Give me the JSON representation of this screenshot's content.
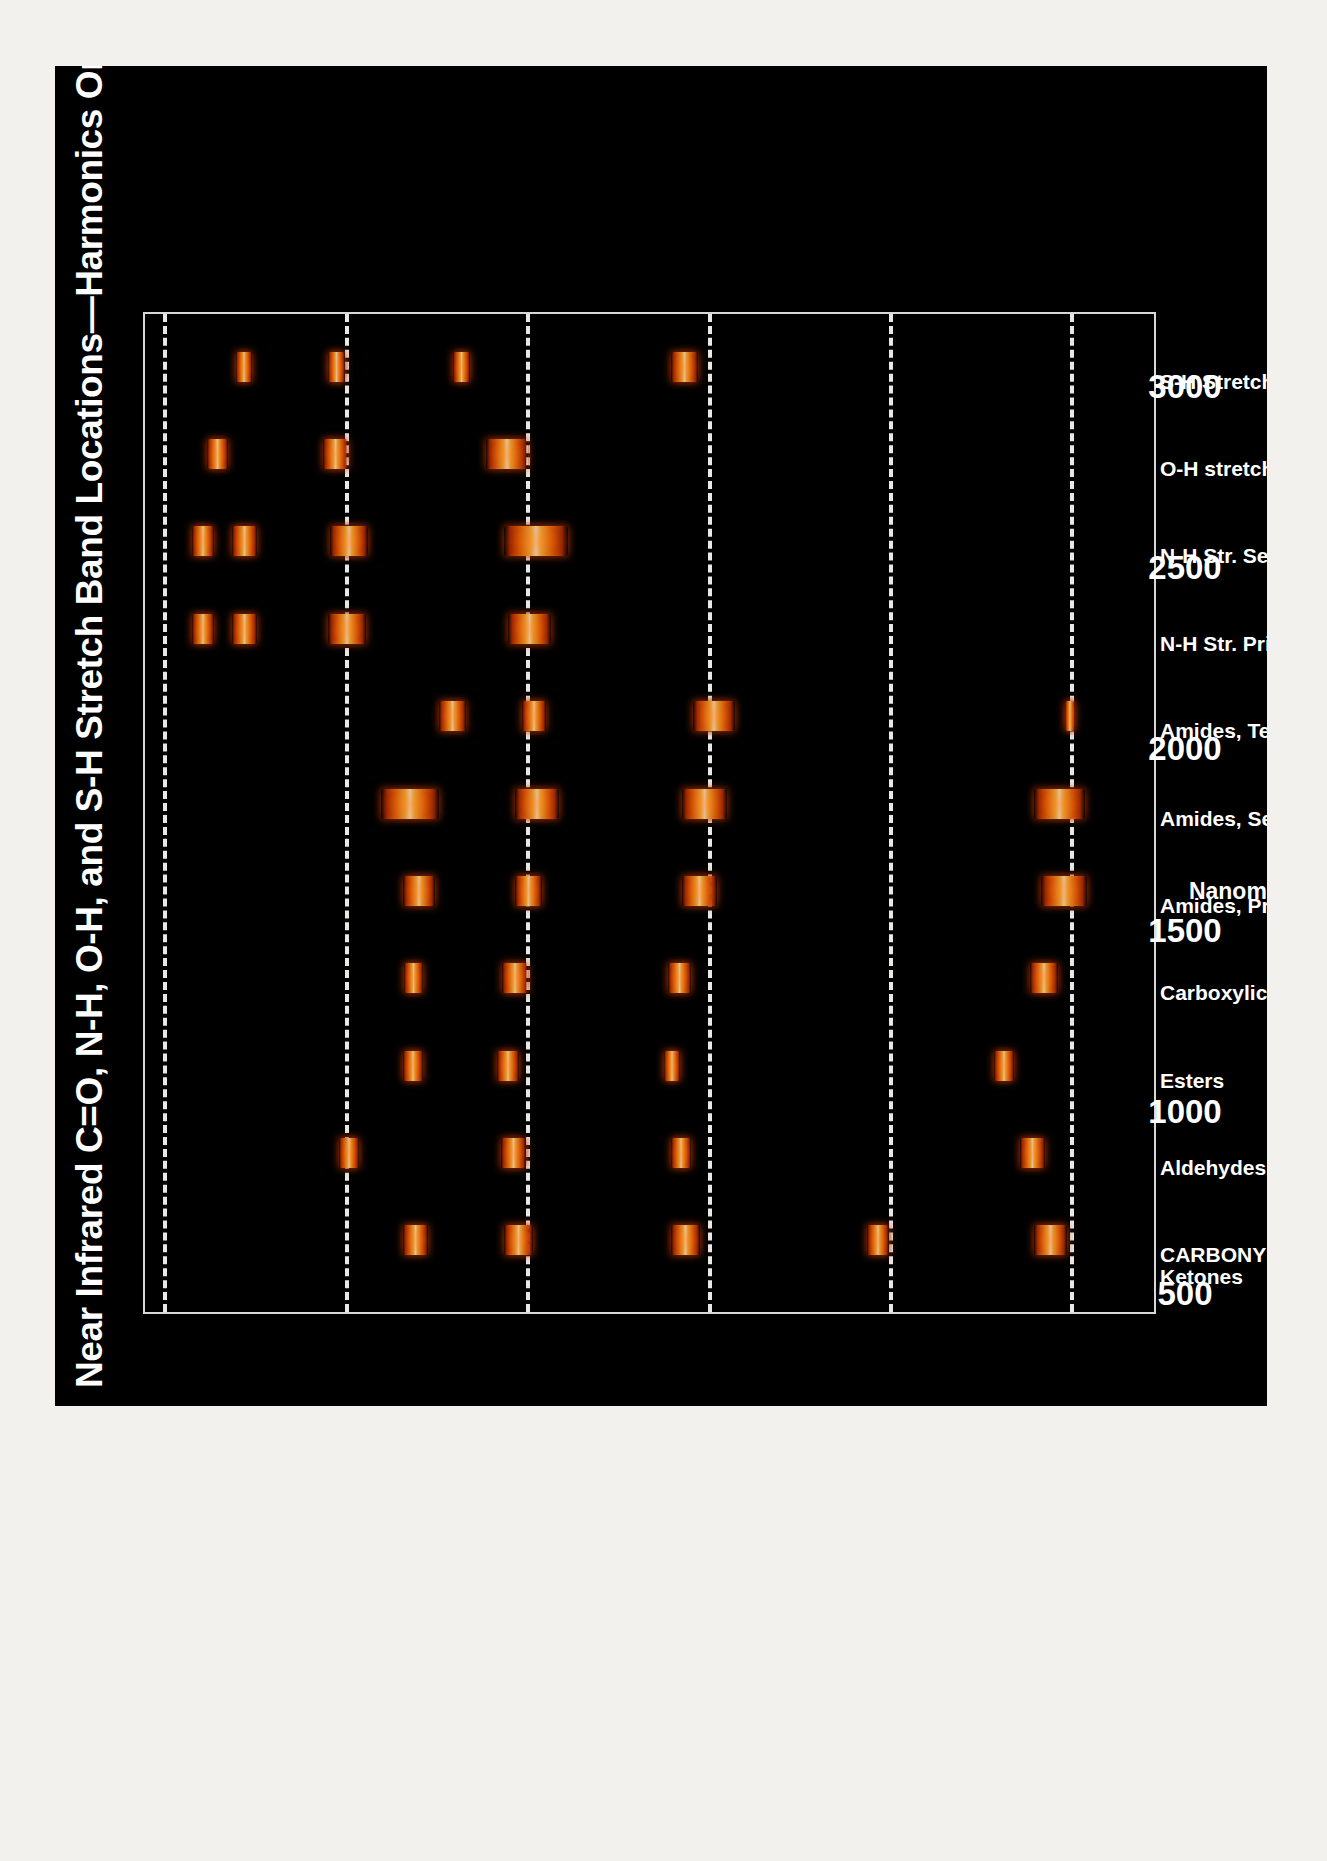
{
  "poster": {
    "background_color": "#000000",
    "page_background": "#f2f1ee"
  },
  "chart_data": {
    "type": "bar",
    "orientation": "rotated-90-ccw",
    "title": "Near Infrared C=O, N-H, O-H, and S-H Stretch Band Locations—Harmonics Only",
    "xlabel": "Nanometers (nm)",
    "ylabel": "",
    "xlim": [
      450,
      3200
    ],
    "xticks": [
      "500",
      "1000",
      "1500",
      "2000",
      "2500",
      "3000"
    ],
    "xtick_values": [
      500,
      1000,
      1500,
      2000,
      2500,
      3000
    ],
    "grid": "dashed-white-vertical-at-xticks",
    "legend": "none",
    "band_color_core": "#fff0be",
    "band_color_mid": "#fcbe3c",
    "band_color_edge": "#b02d03",
    "frame_color": "#d8d8d4",
    "gridline_color": "#e8e8e4",
    "categories": [
      "CARBONYL C=O STR.\nKetones",
      "Aldehydes",
      "Esters",
      "Carboxylic Acids",
      "Amides, Primary",
      "Amides, Secondary",
      "Amides, Tertiary",
      "N-H Str. Primary",
      "N-H Str. Secondary",
      "O-H stretch (all types)",
      "S-H Stretch (all types)"
    ],
    "bands": [
      {
        "category": "CARBONYL C=O STR. Ketones",
        "start": 1160,
        "end": 1230
      },
      {
        "category": "CARBONYL C=O STR. Ketones",
        "start": 1440,
        "end": 1520
      },
      {
        "category": "CARBONYL C=O STR. Ketones",
        "start": 1900,
        "end": 1980
      },
      {
        "category": "CARBONYL C=O STR. Ketones",
        "start": 2440,
        "end": 2500
      },
      {
        "category": "CARBONYL C=O STR. Ketones",
        "start": 2900,
        "end": 2990
      },
      {
        "category": "Aldehydes",
        "start": 985,
        "end": 1040
      },
      {
        "category": "Aldehydes",
        "start": 1430,
        "end": 1500
      },
      {
        "category": "Aldehydes",
        "start": 1900,
        "end": 1955
      },
      {
        "category": "Aldehydes",
        "start": 2860,
        "end": 2930
      },
      {
        "category": "Esters",
        "start": 1160,
        "end": 1215
      },
      {
        "category": "Esters",
        "start": 1420,
        "end": 1480
      },
      {
        "category": "Esters",
        "start": 1880,
        "end": 1925
      },
      {
        "category": "Esters",
        "start": 2790,
        "end": 2845
      },
      {
        "category": "Carboxylic Acids",
        "start": 1165,
        "end": 1215
      },
      {
        "category": "Carboxylic Acids",
        "start": 1435,
        "end": 1505
      },
      {
        "category": "Carboxylic Acids",
        "start": 1890,
        "end": 1955
      },
      {
        "category": "Carboxylic Acids",
        "start": 2890,
        "end": 2965
      },
      {
        "category": "Amides, Primary",
        "start": 1160,
        "end": 1250
      },
      {
        "category": "Amides, Primary",
        "start": 1470,
        "end": 1545
      },
      {
        "category": "Amides, Primary",
        "start": 1930,
        "end": 2025
      },
      {
        "category": "Amides, Primary",
        "start": 2920,
        "end": 3045
      },
      {
        "category": "Amides, Secondary",
        "start": 1100,
        "end": 1260
      },
      {
        "category": "Amides, Secondary",
        "start": 1470,
        "end": 1590
      },
      {
        "category": "Amides, Secondary",
        "start": 1930,
        "end": 2055
      },
      {
        "category": "Amides, Secondary",
        "start": 2900,
        "end": 3040
      },
      {
        "category": "Amides, Tertiary",
        "start": 1260,
        "end": 1335
      },
      {
        "category": "Amides, Tertiary",
        "start": 1490,
        "end": 1555
      },
      {
        "category": "Amides, Tertiary",
        "start": 1960,
        "end": 2075
      },
      {
        "category": "Amides, Tertiary",
        "start": 2985,
        "end": 3010
      },
      {
        "category": "N-H Str. Primary",
        "start": 580,
        "end": 640
      },
      {
        "category": "N-H Str. Primary",
        "start": 690,
        "end": 760
      },
      {
        "category": "N-H Str. Primary",
        "start": 955,
        "end": 1060
      },
      {
        "category": "N-H Str. Primary",
        "start": 1450,
        "end": 1570
      },
      {
        "category": "N-H Str. Secondary",
        "start": 580,
        "end": 640
      },
      {
        "category": "N-H Str. Secondary",
        "start": 690,
        "end": 760
      },
      {
        "category": "N-H Str. Secondary",
        "start": 960,
        "end": 1065
      },
      {
        "category": "N-H Str. Secondary",
        "start": 1440,
        "end": 1615
      },
      {
        "category": "O-H stretch (all types)",
        "start": 620,
        "end": 680
      },
      {
        "category": "O-H stretch (all types)",
        "start": 940,
        "end": 1010
      },
      {
        "category": "O-H stretch (all types)",
        "start": 1390,
        "end": 1505
      },
      {
        "category": "S-H Stretch (all types)",
        "start": 700,
        "end": 745
      },
      {
        "category": "S-H Stretch (all types)",
        "start": 955,
        "end": 1000
      },
      {
        "category": "S-H Stretch (all types)",
        "start": 1300,
        "end": 1345
      },
      {
        "category": "S-H Stretch (all types)",
        "start": 1900,
        "end": 1975
      }
    ]
  }
}
